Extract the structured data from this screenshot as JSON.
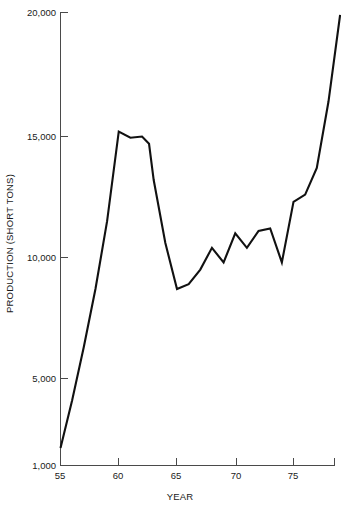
{
  "chart_data": {
    "type": "line",
    "title": "",
    "xlabel": "YEAR",
    "ylabel": "PRODUCTION (SHORT TONS)",
    "xlim": [
      55,
      79.5
    ],
    "ylim": [
      1000,
      20000
    ],
    "grid": false,
    "legend": false,
    "x_tick_labels": [
      "55",
      "60",
      "65",
      "70",
      "75"
    ],
    "x_tick_values": [
      55,
      60,
      65,
      70,
      75
    ],
    "y_tick_labels": [
      "1,000",
      "5,000",
      "10,000",
      "15,000",
      "20,000"
    ],
    "y_tick_values": [
      1000,
      5000,
      10000,
      15000,
      20000
    ],
    "series": [
      {
        "name": "Production",
        "color": "#111111",
        "x": [
          55,
          56,
          57,
          58,
          59,
          60,
          61,
          62,
          62.6,
          63,
          64,
          65,
          66,
          67,
          68,
          69,
          70,
          71,
          72,
          73,
          74,
          75,
          76,
          77,
          78,
          79
        ],
        "values": [
          1800,
          4000,
          6300,
          8700,
          11500,
          15200,
          14950,
          15000,
          14700,
          13200,
          10600,
          8700,
          8900,
          9500,
          10400,
          9800,
          11000,
          10400,
          11100,
          11200,
          9800,
          12300,
          12600,
          13700,
          16400,
          19900
        ]
      }
    ]
  },
  "axis_style": {
    "axis_color": "#4a4a4a",
    "line_color": "#111111",
    "background": "#ffffff"
  }
}
